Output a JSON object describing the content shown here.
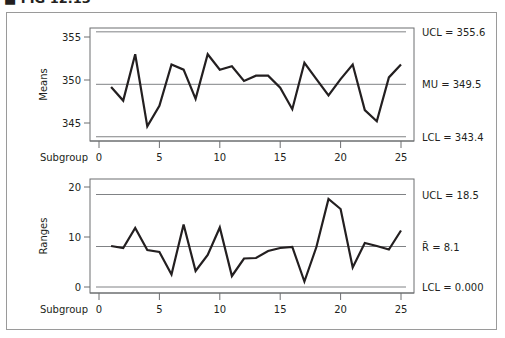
{
  "figure": {
    "title": "■ FIG 12.13"
  },
  "chart_data": [
    {
      "type": "line",
      "name": "means-chart",
      "title": "",
      "xlabel": "Subgroup",
      "ylabel": "Means",
      "x": [
        1,
        2,
        3,
        4,
        5,
        6,
        7,
        8,
        9,
        10,
        11,
        12,
        13,
        14,
        15,
        16,
        17,
        18,
        19,
        20,
        21,
        22,
        23,
        24,
        25
      ],
      "values": [
        349.2,
        347.6,
        353.0,
        344.6,
        347.0,
        351.8,
        351.2,
        347.8,
        353.0,
        351.2,
        351.6,
        349.9,
        350.5,
        350.5,
        349.1,
        346.6,
        352.0,
        350.1,
        348.2,
        350.1,
        351.8,
        346.5,
        345.2,
        350.3,
        351.8
      ],
      "xticks": [
        0,
        5,
        10,
        15,
        20,
        25
      ],
      "yticks": [
        345,
        350,
        355
      ],
      "ylim": [
        343.0,
        356.0
      ],
      "xlim": [
        0,
        25
      ],
      "reference_lines": [
        {
          "name": "UCL",
          "value": 355.6,
          "label": "UCL = 355.6"
        },
        {
          "name": "MU",
          "value": 349.5,
          "label": "MU = 349.5"
        },
        {
          "name": "LCL",
          "value": 343.4,
          "label": "LCL = 343.4"
        }
      ],
      "grid": false
    },
    {
      "type": "line",
      "name": "ranges-chart",
      "title": "",
      "xlabel": "Subgroup",
      "ylabel": "Ranges",
      "x": [
        1,
        2,
        3,
        4,
        5,
        6,
        7,
        8,
        9,
        10,
        11,
        12,
        13,
        14,
        15,
        16,
        17,
        18,
        19,
        20,
        21,
        22,
        23,
        24,
        25
      ],
      "values": [
        8.2,
        7.8,
        11.8,
        7.4,
        7.0,
        2.5,
        12.5,
        3.2,
        6.4,
        11.9,
        2.2,
        5.7,
        5.8,
        7.2,
        7.8,
        8.0,
        1.1,
        8.0,
        17.6,
        15.6,
        3.9,
        8.8,
        8.2,
        7.5,
        11.3
      ],
      "xticks": [
        0,
        5,
        10,
        15,
        20,
        25
      ],
      "yticks": [
        0,
        10,
        20
      ],
      "ylim": [
        -1.0,
        21.0
      ],
      "xlim": [
        0,
        25
      ],
      "reference_lines": [
        {
          "name": "UCL",
          "value": 18.5,
          "label": "UCL = 18.5"
        },
        {
          "name": "RBAR",
          "value": 8.1,
          "label": "R̄ = 8.1"
        },
        {
          "name": "LCL",
          "value": 0.0,
          "label": "LCL = 0.000"
        }
      ],
      "grid": false
    }
  ]
}
